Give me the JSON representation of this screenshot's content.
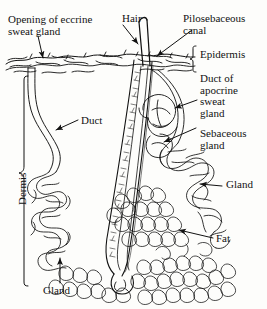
{
  "figure": {
    "kind": "anatomical-diagram",
    "background_color": "#fdfdfb",
    "ink_color": "#121212",
    "width": 267,
    "height": 309
  },
  "labels": {
    "opening_eccrine": "Opening of eccrine\nsweat gland",
    "hair": "Hair",
    "pilosebaceous": "Pilosebaceous\ncanal",
    "epidermis": "Epidermis",
    "duct_apocrine": "Duct of\napocrine\nsweat\ngland",
    "sebaceous": "Sebaceous\ngland",
    "duct": "Duct",
    "dermis": "Dermis",
    "gland_right": "Gland",
    "fat": "Fat",
    "gland_left": "Gland"
  },
  "structures": [
    {
      "name": "epidermis-band",
      "label": "Epidermis"
    },
    {
      "name": "dermis-region",
      "label": "Dermis"
    },
    {
      "name": "subcutaneous-fat",
      "label": "Fat"
    },
    {
      "name": "hair-shaft",
      "label": "Hair"
    },
    {
      "name": "hair-follicle",
      "label": "Pilosebaceous canal"
    },
    {
      "name": "sebaceous-gland",
      "label": "Sebaceous gland"
    },
    {
      "name": "apocrine-duct",
      "label": "Duct of apocrine sweat gland"
    },
    {
      "name": "apocrine-gland",
      "label": "Gland"
    },
    {
      "name": "eccrine-duct",
      "label": "Duct"
    },
    {
      "name": "eccrine-gland",
      "label": "Gland"
    },
    {
      "name": "eccrine-pore",
      "label": "Opening of eccrine sweat gland"
    }
  ]
}
